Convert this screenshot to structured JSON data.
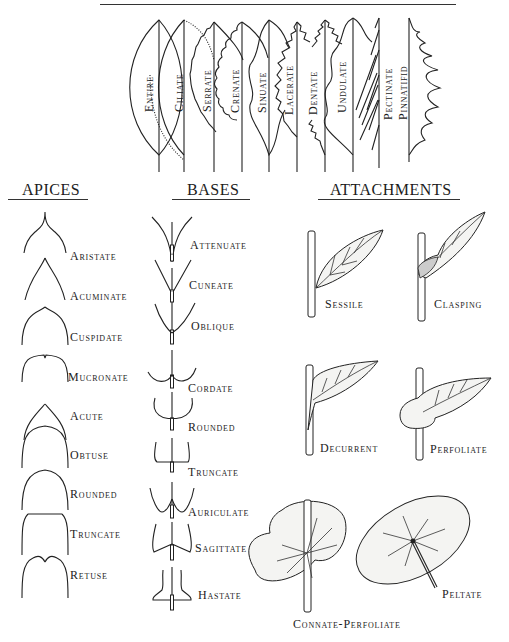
{
  "margins": {
    "title": "MARGINS",
    "items": [
      {
        "label": "Entire",
        "x": 159
      },
      {
        "label": "Ciliate",
        "x": 184
      },
      {
        "label": "Serrate",
        "x": 214
      },
      {
        "label": "Crenate",
        "x": 242
      },
      {
        "label": "Sinuate",
        "x": 269
      },
      {
        "label": "Lacerate",
        "x": 297
      },
      {
        "label": "Dentate",
        "x": 325
      },
      {
        "label": "Undulate",
        "x": 353
      },
      {
        "label": "Pectinate",
        "x": 379
      },
      {
        "label": "Pinnatifid",
        "x": 409
      }
    ]
  },
  "apices": {
    "title": "APICES",
    "items": [
      {
        "label": "Aristate"
      },
      {
        "label": "Acuminate"
      },
      {
        "label": "Cuspidate"
      },
      {
        "label": "Mucronate"
      },
      {
        "label": "Acute"
      },
      {
        "label": "Obtuse"
      },
      {
        "label": "Rounded"
      },
      {
        "label": "Truncate"
      },
      {
        "label": "Retuse"
      }
    ]
  },
  "bases": {
    "title": "BASES",
    "items": [
      {
        "label": "Attenuate"
      },
      {
        "label": "Cuneate"
      },
      {
        "label": "Oblique"
      },
      {
        "label": "Cordate"
      },
      {
        "label": "Rounded"
      },
      {
        "label": "Truncate"
      },
      {
        "label": "Auriculate"
      },
      {
        "label": "Sagittate"
      },
      {
        "label": "Hastate"
      }
    ]
  },
  "attachments": {
    "title": "ATTACHMENTS",
    "items": [
      {
        "label": "Sessile"
      },
      {
        "label": "Clasping"
      },
      {
        "label": "Decurrent"
      },
      {
        "label": "Perfoliate"
      },
      {
        "label": "Connate-Perfoliate"
      },
      {
        "label": "Peltate"
      }
    ]
  }
}
